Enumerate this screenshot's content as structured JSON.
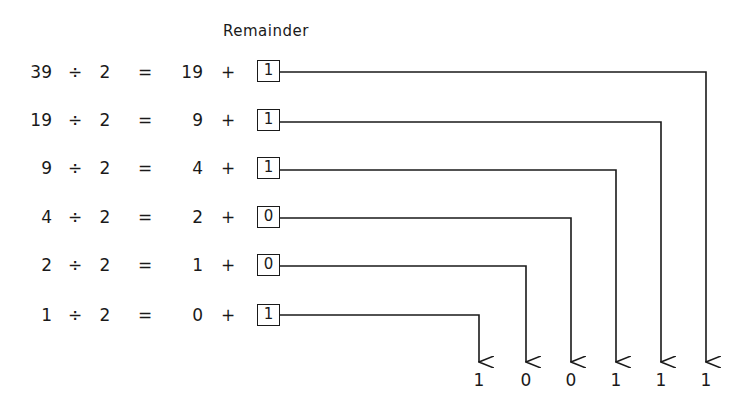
{
  "header": {
    "label": "Remainder"
  },
  "rows": [
    {
      "dividend": "39",
      "op": "÷",
      "divisor": "2",
      "eq": "=",
      "quotient": "19",
      "plus": "+",
      "remainder": "1"
    },
    {
      "dividend": "19",
      "op": "÷",
      "divisor": "2",
      "eq": "=",
      "quotient": "9",
      "plus": "+",
      "remainder": "1"
    },
    {
      "dividend": "9",
      "op": "÷",
      "divisor": "2",
      "eq": "=",
      "quotient": "4",
      "plus": "+",
      "remainder": "1"
    },
    {
      "dividend": "4",
      "op": "÷",
      "divisor": "2",
      "eq": "=",
      "quotient": "2",
      "plus": "+",
      "remainder": "0"
    },
    {
      "dividend": "2",
      "op": "÷",
      "divisor": "2",
      "eq": "=",
      "quotient": "1",
      "plus": "+",
      "remainder": "0"
    },
    {
      "dividend": "1",
      "op": "÷",
      "divisor": "2",
      "eq": "=",
      "quotient": "0",
      "plus": "+",
      "remainder": "1"
    }
  ],
  "result_bits": [
    "1",
    "0",
    "0",
    "1",
    "1",
    "1"
  ]
}
